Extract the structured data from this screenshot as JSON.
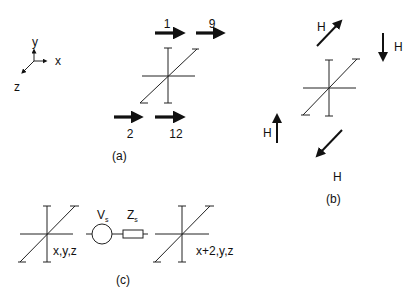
{
  "figure": {
    "axes": {
      "x_label": "x",
      "y_label": "y",
      "z_label": "z"
    },
    "panel_a": {
      "caption": "(a)",
      "arrows": [
        {
          "label": "1",
          "direction": "right",
          "position": "top-left"
        },
        {
          "label": "9",
          "direction": "right",
          "position": "top-right"
        },
        {
          "label": "2",
          "direction": "right",
          "position": "bottom-left"
        },
        {
          "label": "12",
          "direction": "right",
          "position": "bottom-right"
        }
      ]
    },
    "panel_b": {
      "caption": "(b)",
      "arrows": [
        {
          "label": "H",
          "direction": "up-right",
          "position": "top-left"
        },
        {
          "label": "H",
          "direction": "down",
          "position": "top-right"
        },
        {
          "label": "H",
          "direction": "up",
          "position": "bottom-left"
        },
        {
          "label": "H",
          "direction": "down-left",
          "position": "bottom"
        }
      ]
    },
    "panel_c": {
      "caption": "(c)",
      "left_node_label": "x,y,z",
      "right_node_label": "x+2,y,z",
      "source": {
        "symbol": "V",
        "subscript": "s"
      },
      "impedance": {
        "symbol": "Z",
        "subscript": "s"
      }
    }
  }
}
